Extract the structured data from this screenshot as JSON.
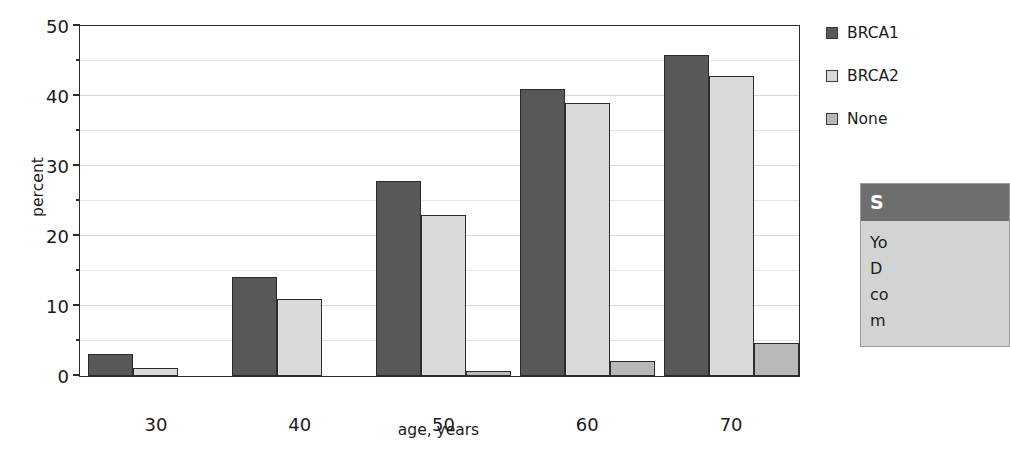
{
  "chart_data": {
    "type": "bar",
    "title": "",
    "xlabel": "age, years",
    "ylabel": "percent",
    "categories": [
      "30",
      "40",
      "50",
      "60",
      "70"
    ],
    "series": [
      {
        "name": "BRCA1",
        "color": "#585858",
        "values": [
          3.2,
          14.1,
          27.9,
          41.0,
          45.9
        ]
      },
      {
        "name": "BRCA2",
        "color": "#dadada",
        "values": [
          1.2,
          11.0,
          23.0,
          39.0,
          42.8
        ]
      },
      {
        "name": "None",
        "color": "#b9b9b9",
        "values": [
          0.0,
          0.0,
          0.7,
          2.2,
          4.7
        ]
      }
    ],
    "ylim": [
      0,
      50
    ],
    "yticks": [
      0,
      10,
      20,
      30,
      40,
      50
    ],
    "yticklabels": [
      "0",
      "10",
      "20",
      "30",
      "40",
      "50"
    ],
    "yminorticks": [
      5,
      15,
      25,
      35,
      45
    ],
    "grid": true,
    "legend_position": "right"
  },
  "legend": {
    "items": [
      {
        "label": "BRCA1",
        "color": "#585858"
      },
      {
        "label": "BRCA2",
        "color": "#dadada"
      },
      {
        "label": "None",
        "color": "#b9b9b9"
      }
    ]
  },
  "callout": {
    "header": "S",
    "lines": [
      "Yo",
      "D",
      "co",
      "m"
    ]
  }
}
